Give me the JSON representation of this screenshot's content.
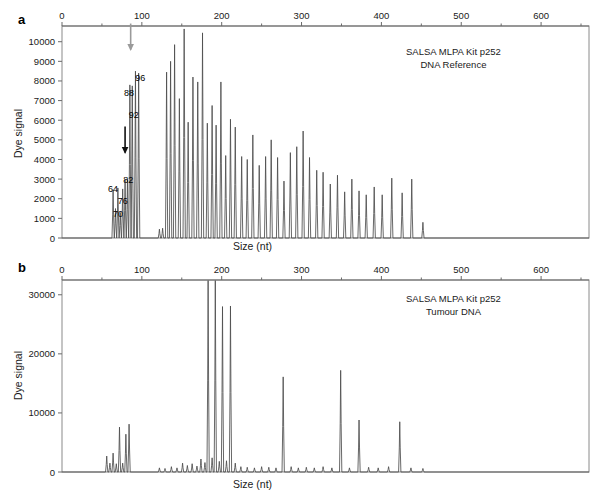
{
  "figure": {
    "panels": [
      {
        "letter": "a",
        "xlabel": "Size (nt)",
        "ylabel": "Dye signal",
        "annotation_line1": "SALSA MLPA Kit p252",
        "annotation_line2": "DNA Reference"
      },
      {
        "letter": "b",
        "xlabel": "Size (nt)",
        "ylabel": "Dye signal",
        "annotation_line1": "SALSA MLPA Kit p252",
        "annotation_line2": "Tumour DNA"
      }
    ]
  },
  "chart_data": [
    {
      "type": "line",
      "panel": "a",
      "title": "SALSA MLPA Kit p252 DNA Reference",
      "subtitle": "DNA Reference",
      "xlabel": "Size (nt)",
      "ylabel": "Dye signal",
      "xlim": [
        0,
        660
      ],
      "ylim": [
        0,
        10800
      ],
      "xticks": [
        0,
        100,
        200,
        300,
        400,
        500,
        600
      ],
      "xminorticks": [
        50,
        150,
        250,
        350,
        450,
        550,
        650
      ],
      "yticks": [
        0,
        1000,
        2000,
        3000,
        4000,
        5000,
        6000,
        7000,
        8000,
        9000,
        10000
      ],
      "xaxis_position": "top",
      "grid": false,
      "legend": false,
      "annotations": [
        {
          "text": "64",
          "x": 64,
          "y": 2350,
          "kind": "peak-label"
        },
        {
          "text": "70",
          "x": 70,
          "y": 1050,
          "kind": "peak-label"
        },
        {
          "text": "76",
          "x": 76,
          "y": 1750,
          "kind": "peak-label"
        },
        {
          "text": "82",
          "x": 83,
          "y": 2800,
          "kind": "peak-label"
        },
        {
          "text": "88",
          "x": 84,
          "y": 7250,
          "kind": "peak-label"
        },
        {
          "text": "92",
          "x": 90,
          "y": 6100,
          "kind": "peak-label"
        },
        {
          "text": "96",
          "x": 98,
          "y": 8000,
          "kind": "peak-label"
        },
        {
          "text": "",
          "x": 86,
          "y": 9600,
          "kind": "arrow-down-gray",
          "color": "#9a9a9a"
        },
        {
          "text": "",
          "x": 79,
          "y": 4350,
          "kind": "arrow-down-black",
          "color": "#111111"
        }
      ],
      "peaks": [
        {
          "x": 64,
          "y": 2450
        },
        {
          "x": 67,
          "y": 1500
        },
        {
          "x": 70,
          "y": 2550
        },
        {
          "x": 73,
          "y": 1300
        },
        {
          "x": 76,
          "y": 2500
        },
        {
          "x": 79,
          "y": 2950
        },
        {
          "x": 82,
          "y": 3000
        },
        {
          "x": 85,
          "y": 7800
        },
        {
          "x": 88,
          "y": 7750
        },
        {
          "x": 92,
          "y": 8500
        },
        {
          "x": 96,
          "y": 8400
        },
        {
          "x": 122,
          "y": 450
        },
        {
          "x": 126,
          "y": 500
        },
        {
          "x": 131,
          "y": 8450
        },
        {
          "x": 136,
          "y": 9000
        },
        {
          "x": 141,
          "y": 9850
        },
        {
          "x": 147,
          "y": 7100
        },
        {
          "x": 153,
          "y": 10650
        },
        {
          "x": 158,
          "y": 5900
        },
        {
          "x": 164,
          "y": 8200
        },
        {
          "x": 170,
          "y": 7950
        },
        {
          "x": 176,
          "y": 10450
        },
        {
          "x": 182,
          "y": 5850
        },
        {
          "x": 188,
          "y": 6750
        },
        {
          "x": 193,
          "y": 5750
        },
        {
          "x": 199,
          "y": 7950
        },
        {
          "x": 205,
          "y": 4200
        },
        {
          "x": 211,
          "y": 6050
        },
        {
          "x": 217,
          "y": 5650
        },
        {
          "x": 225,
          "y": 4150
        },
        {
          "x": 232,
          "y": 4000
        },
        {
          "x": 239,
          "y": 5250
        },
        {
          "x": 247,
          "y": 3700
        },
        {
          "x": 255,
          "y": 4150
        },
        {
          "x": 262,
          "y": 5000
        },
        {
          "x": 270,
          "y": 4100
        },
        {
          "x": 278,
          "y": 2900
        },
        {
          "x": 286,
          "y": 4350
        },
        {
          "x": 294,
          "y": 4650
        },
        {
          "x": 302,
          "y": 5450
        },
        {
          "x": 310,
          "y": 4100
        },
        {
          "x": 319,
          "y": 3450
        },
        {
          "x": 327,
          "y": 3350
        },
        {
          "x": 336,
          "y": 2750
        },
        {
          "x": 345,
          "y": 3200
        },
        {
          "x": 354,
          "y": 2350
        },
        {
          "x": 363,
          "y": 3000
        },
        {
          "x": 372,
          "y": 2400
        },
        {
          "x": 381,
          "y": 2200
        },
        {
          "x": 391,
          "y": 2600
        },
        {
          "x": 401,
          "y": 2200
        },
        {
          "x": 413,
          "y": 3050
        },
        {
          "x": 426,
          "y": 2300
        },
        {
          "x": 438,
          "y": 3000
        },
        {
          "x": 452,
          "y": 800
        }
      ]
    },
    {
      "type": "line",
      "panel": "b",
      "title": "SALSA MLPA Kit p252 Tumour DNA",
      "subtitle": "Tumour DNA",
      "xlabel": "Size (nt)",
      "ylabel": "Dye signal",
      "xlim": [
        0,
        660
      ],
      "ylim": [
        0,
        32500
      ],
      "xticks": [
        0,
        100,
        200,
        300,
        400,
        500,
        600
      ],
      "xminorticks": [
        50,
        150,
        250,
        350,
        450,
        550,
        650
      ],
      "yticks": [
        0,
        10000,
        20000,
        30000
      ],
      "xaxis_position": "top",
      "grid": false,
      "legend": false,
      "annotations": [],
      "peaks": [
        {
          "x": 56,
          "y": 2700
        },
        {
          "x": 60,
          "y": 1500
        },
        {
          "x": 64,
          "y": 3200
        },
        {
          "x": 68,
          "y": 1400
        },
        {
          "x": 72,
          "y": 7600
        },
        {
          "x": 76,
          "y": 1500
        },
        {
          "x": 80,
          "y": 6400
        },
        {
          "x": 84,
          "y": 8100
        },
        {
          "x": 122,
          "y": 700
        },
        {
          "x": 129,
          "y": 600
        },
        {
          "x": 137,
          "y": 900
        },
        {
          "x": 144,
          "y": 700
        },
        {
          "x": 151,
          "y": 1500
        },
        {
          "x": 157,
          "y": 1100
        },
        {
          "x": 163,
          "y": 1400
        },
        {
          "x": 169,
          "y": 1000
        },
        {
          "x": 174,
          "y": 2200
        },
        {
          "x": 179,
          "y": 1600
        },
        {
          "x": 183,
          "y": 32400
        },
        {
          "x": 188,
          "y": 2400
        },
        {
          "x": 192,
          "y": 32400
        },
        {
          "x": 197,
          "y": 1800
        },
        {
          "x": 201,
          "y": 28000
        },
        {
          "x": 206,
          "y": 1900
        },
        {
          "x": 211,
          "y": 28100
        },
        {
          "x": 217,
          "y": 1500
        },
        {
          "x": 224,
          "y": 900
        },
        {
          "x": 232,
          "y": 800
        },
        {
          "x": 241,
          "y": 700
        },
        {
          "x": 250,
          "y": 900
        },
        {
          "x": 259,
          "y": 800
        },
        {
          "x": 268,
          "y": 700
        },
        {
          "x": 277,
          "y": 16100
        },
        {
          "x": 287,
          "y": 900
        },
        {
          "x": 296,
          "y": 700
        },
        {
          "x": 306,
          "y": 800
        },
        {
          "x": 316,
          "y": 700
        },
        {
          "x": 327,
          "y": 900
        },
        {
          "x": 338,
          "y": 700
        },
        {
          "x": 349,
          "y": 17200
        },
        {
          "x": 360,
          "y": 700
        },
        {
          "x": 372,
          "y": 8800
        },
        {
          "x": 384,
          "y": 800
        },
        {
          "x": 396,
          "y": 700
        },
        {
          "x": 409,
          "y": 900
        },
        {
          "x": 423,
          "y": 8500
        },
        {
          "x": 437,
          "y": 700
        },
        {
          "x": 452,
          "y": 600
        }
      ]
    }
  ]
}
